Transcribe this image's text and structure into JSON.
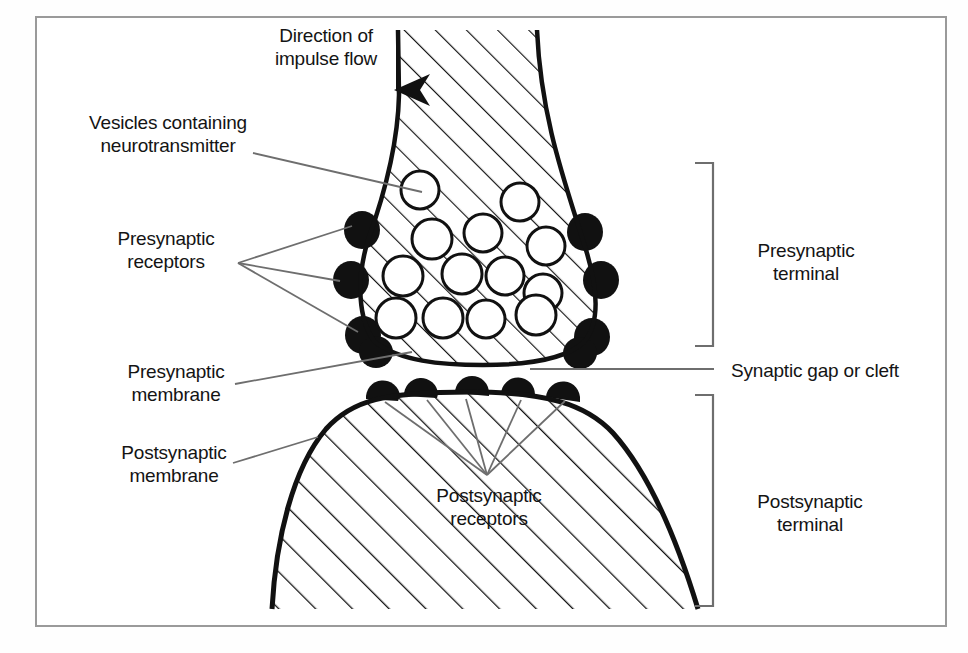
{
  "figure": {
    "background_color": "#ffffff",
    "frame_color": "#9a9a9a",
    "ink_color": "#111111",
    "leader_color": "#6e6e6e"
  },
  "labels": {
    "direction_of_impulse_flow": "Direction of\nimpulse flow",
    "vesicles_containing_neurotransmitter": "Vesicles containing\nneurotransmitter",
    "presynaptic_receptors": "Presynaptic\nreceptors",
    "presynaptic_membrane": "Presynaptic\nmembrane",
    "postsynaptic_membrane": "Postsynaptic\nmembrane",
    "postsynaptic_receptors": "Postsynaptic\nreceptors",
    "presynaptic_terminal": "Presynaptic\nterminal",
    "synaptic_gap_or_cleft": "Synaptic gap or cleft",
    "postsynaptic_terminal": "Postsynaptic\nterminal"
  },
  "icons": {
    "impulse_arrow": "down-arrow-icon",
    "presynaptic_terminal_bracket": "right-bracket-icon",
    "postsynaptic_terminal_bracket": "right-bracket-icon",
    "synaptic_cleft_leader": "leader-line-icon"
  },
  "geometry": {
    "presynaptic_terminal_outline": "M 398,30 L 399,95 C 398,140 386,190 368,240 C 356,280 358,320 375,342 C 400,360 440,364 483,364 C 530,364 566,358 584,342 C 600,322 596,286 586,250 C 566,185 540,120 536,30 Z",
    "postsynaptic_terminal_outline": "M 273,608 C 276,540 292,470 325,430 C 350,402 382,393 470,393 C 545,393 585,404 612,432 C 648,472 676,540 697,608 Z",
    "vesicles": [
      {
        "cx": 420,
        "cy": 190,
        "r": 19
      },
      {
        "cx": 432,
        "cy": 239,
        "r": 20
      },
      {
        "cx": 483,
        "cy": 233,
        "r": 19
      },
      {
        "cx": 520,
        "cy": 202,
        "r": 19
      },
      {
        "cx": 546,
        "cy": 246,
        "r": 19
      },
      {
        "cx": 403,
        "cy": 276,
        "r": 20
      },
      {
        "cx": 462,
        "cy": 274,
        "r": 20
      },
      {
        "cx": 505,
        "cy": 276,
        "r": 19
      },
      {
        "cx": 543,
        "cy": 293,
        "r": 19
      },
      {
        "cx": 396,
        "cy": 318,
        "r": 20
      },
      {
        "cx": 443,
        "cy": 318,
        "r": 20
      },
      {
        "cx": 486,
        "cy": 319,
        "r": 19
      },
      {
        "cx": 536,
        "cy": 315,
        "r": 20
      }
    ],
    "presynaptic_receptor_blobs_left": [
      {
        "cx": 362,
        "cy": 230,
        "r": 17
      },
      {
        "cx": 351,
        "cy": 280,
        "r": 17
      },
      {
        "cx": 363,
        "cy": 335,
        "r": 17
      }
    ],
    "presynaptic_receptor_blobs_right": [
      {
        "cx": 585,
        "cy": 232,
        "r": 17
      },
      {
        "cx": 601,
        "cy": 280,
        "r": 17
      },
      {
        "cx": 592,
        "cy": 337,
        "r": 17
      }
    ],
    "postsynaptic_receptor_blobs": [
      {
        "cx": 382,
        "cy": 397,
        "r": 16
      },
      {
        "cx": 420,
        "cy": 395,
        "r": 16
      },
      {
        "cx": 472,
        "cy": 393,
        "r": 16
      },
      {
        "cx": 518,
        "cy": 394,
        "r": 16
      },
      {
        "cx": 563,
        "cy": 396,
        "r": 16
      }
    ],
    "impulse_arrow": {
      "x": 398,
      "y_start": 30,
      "y_end": 98
    },
    "presynaptic_bracket": {
      "x": 713,
      "y_top": 163,
      "y_bottom": 346,
      "tick": 18
    },
    "postsynaptic_bracket": {
      "x": 713,
      "y_top": 395,
      "y_bottom": 606,
      "tick": 18
    },
    "cleft_leader": {
      "x1": 530,
      "y1": 369,
      "x2": 714,
      "y2": 369
    }
  }
}
